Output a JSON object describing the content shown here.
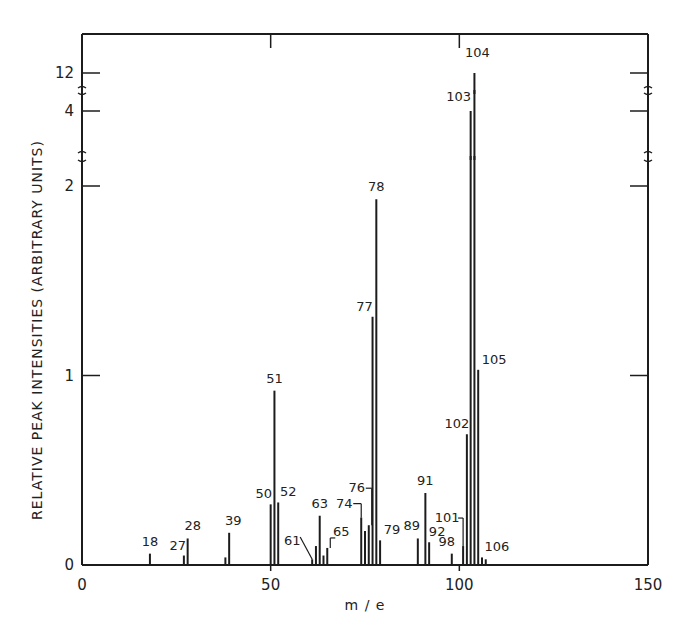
{
  "chart_data": {
    "type": "bar",
    "subtype": "mass-spectrum-stick",
    "title": "",
    "xlabel": "m / e",
    "ylabel": "RELATIVE PEAK INTENSITIES (ARBITRARY UNITS)",
    "xlim": [
      0,
      150
    ],
    "x_ticks": [
      0,
      50,
      100,
      150
    ],
    "y_ticks": [
      0,
      1,
      2,
      4,
      12
    ],
    "y_axis_breaks": [
      [
        2.1,
        3.5
      ],
      [
        4.3,
        11.5
      ]
    ],
    "grid": false,
    "legend": null,
    "peaks": [
      {
        "mz": 18,
        "intensity": 0.06,
        "label": "18"
      },
      {
        "mz": 27,
        "intensity": 0.05,
        "label": "27"
      },
      {
        "mz": 28,
        "intensity": 0.14,
        "label": "28"
      },
      {
        "mz": 38,
        "intensity": 0.04,
        "label": ""
      },
      {
        "mz": 39,
        "intensity": 0.17,
        "label": "39"
      },
      {
        "mz": 50,
        "intensity": 0.32,
        "label": "50"
      },
      {
        "mz": 51,
        "intensity": 0.92,
        "label": "51"
      },
      {
        "mz": 52,
        "intensity": 0.33,
        "label": "52"
      },
      {
        "mz": 61,
        "intensity": 0.03,
        "label": "61"
      },
      {
        "mz": 62,
        "intensity": 0.1,
        "label": ""
      },
      {
        "mz": 63,
        "intensity": 0.26,
        "label": "63"
      },
      {
        "mz": 64,
        "intensity": 0.05,
        "label": ""
      },
      {
        "mz": 65,
        "intensity": 0.09,
        "label": "65"
      },
      {
        "mz": 74,
        "intensity": 0.25,
        "label": "74"
      },
      {
        "mz": 75,
        "intensity": 0.18,
        "label": ""
      },
      {
        "mz": 76,
        "intensity": 0.21,
        "label": "76"
      },
      {
        "mz": 77,
        "intensity": 1.31,
        "label": "77"
      },
      {
        "mz": 78,
        "intensity": 1.93,
        "label": "78"
      },
      {
        "mz": 79,
        "intensity": 0.13,
        "label": "79"
      },
      {
        "mz": 89,
        "intensity": 0.14,
        "label": "89"
      },
      {
        "mz": 91,
        "intensity": 0.38,
        "label": "91"
      },
      {
        "mz": 92,
        "intensity": 0.12,
        "label": "92"
      },
      {
        "mz": 98,
        "intensity": 0.06,
        "label": "98"
      },
      {
        "mz": 101,
        "intensity": 0.1,
        "label": "101"
      },
      {
        "mz": 102,
        "intensity": 0.69,
        "label": "102"
      },
      {
        "mz": 103,
        "intensity": 4.0,
        "label": "103"
      },
      {
        "mz": 104,
        "intensity": 12.0,
        "label": "104"
      },
      {
        "mz": 105,
        "intensity": 1.03,
        "label": "105"
      },
      {
        "mz": 106,
        "intensity": 0.04,
        "label": "106"
      },
      {
        "mz": 107,
        "intensity": 0.03,
        "label": ""
      }
    ]
  },
  "axes": {
    "x_title": "m / e",
    "y_title": "RELATIVE PEAK INTENSITIES (ARBITRARY UNITS)",
    "x_tick_labels": [
      "0",
      "50",
      "100",
      "150"
    ],
    "y_tick_labels": [
      "0",
      "1",
      "2",
      "4",
      "12"
    ]
  }
}
